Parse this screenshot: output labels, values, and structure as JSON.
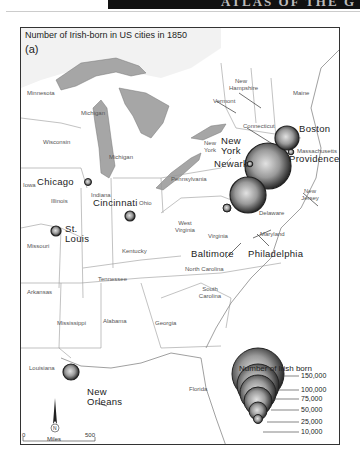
{
  "header": {
    "banner_text": "ATLAS OF THE G"
  },
  "map": {
    "title": "Number of Irish-born in US cities in 1850",
    "panel_label": "(a)",
    "states": [
      {
        "name": "Minnesota",
        "x": 6,
        "y": 62
      },
      {
        "name": "Michigan",
        "x": 60,
        "y": 82
      },
      {
        "name": "Wisconsin",
        "x": 22,
        "y": 111
      },
      {
        "name": "Michigan",
        "x": 88,
        "y": 126
      },
      {
        "name": "Iowa",
        "x": 2,
        "y": 154
      },
      {
        "name": "Illinois",
        "x": 30,
        "y": 170
      },
      {
        "name": "Indiana",
        "x": 70,
        "y": 164
      },
      {
        "name": "Ohio",
        "x": 118,
        "y": 172
      },
      {
        "name": "Pennsylvania",
        "x": 150,
        "y": 148
      },
      {
        "name": "New Hampshire",
        "x": 210,
        "y": 50
      },
      {
        "name": "Vermont",
        "x": 192,
        "y": 70
      },
      {
        "name": "Maine",
        "x": 272,
        "y": 62
      },
      {
        "name": "Connecticut",
        "x": 222,
        "y": 95
      },
      {
        "name": "New York",
        "x": 166,
        "y": 115
      },
      {
        "name": "Massachusetts",
        "x": 276,
        "y": 120
      },
      {
        "name": "New Jersey",
        "x": 282,
        "y": 160
      },
      {
        "name": "Delaware",
        "x": 238,
        "y": 182
      },
      {
        "name": "Maryland",
        "x": 239,
        "y": 203
      },
      {
        "name": "West Virginia",
        "x": 153,
        "y": 192
      },
      {
        "name": "Virginia",
        "x": 187,
        "y": 205
      },
      {
        "name": "Missouri",
        "x": 6,
        "y": 215
      },
      {
        "name": "Kentucky",
        "x": 101,
        "y": 220
      },
      {
        "name": "North Carolina",
        "x": 164,
        "y": 238
      },
      {
        "name": "Tennessee",
        "x": 77,
        "y": 248
      },
      {
        "name": "South Carolina",
        "x": 179,
        "y": 258
      },
      {
        "name": "Arkansas",
        "x": 6,
        "y": 261
      },
      {
        "name": "Mississippi",
        "x": 36,
        "y": 292
      },
      {
        "name": "Alabama",
        "x": 82,
        "y": 290
      },
      {
        "name": "Georgia",
        "x": 134,
        "y": 292
      },
      {
        "name": "Louisiana",
        "x": 8,
        "y": 337
      },
      {
        "name": "Florida",
        "x": 168,
        "y": 358
      }
    ],
    "cities": [
      {
        "name": "Boston",
        "x": 278,
        "y": 96
      },
      {
        "name": "New York",
        "x": 200,
        "y": 108,
        "multiline": "New\nYork"
      },
      {
        "name": "Newark",
        "x": 192,
        "y": 131
      },
      {
        "name": "Providence",
        "x": 268,
        "y": 126
      },
      {
        "name": "Chicago",
        "x": 18,
        "y": 154
      },
      {
        "name": "Cincinnati",
        "x": 72,
        "y": 176
      },
      {
        "name": "St. Louis",
        "x": 48,
        "y": 198
      },
      {
        "name": "Baltimore",
        "x": 170,
        "y": 221
      },
      {
        "name": "Philadelphia",
        "x": 227,
        "y": 221
      },
      {
        "name": "New Orleans",
        "x": 76,
        "y": 358
      }
    ],
    "symbols": [
      {
        "city": "New York",
        "cx": 247,
        "cy": 165,
        "r": 23
      },
      {
        "city": "Philadelphia",
        "cx": 230,
        "cy": 191,
        "r": 18
      },
      {
        "city": "Boston",
        "cx": 288,
        "cy": 139,
        "r": 12
      },
      {
        "city": "New Orleans",
        "cx": 70,
        "cy": 373,
        "r": 8
      },
      {
        "city": "St. Louis",
        "cx": 55,
        "cy": 231,
        "r": 5
      },
      {
        "city": "Cincinnati",
        "cx": 130,
        "cy": 218,
        "r": 5
      },
      {
        "city": "Chicago",
        "cx": 87,
        "cy": 182,
        "r": 3.5
      },
      {
        "city": "Baltimore",
        "cx": 228,
        "cy": 209,
        "r": 4
      },
      {
        "city": "Newark",
        "cx": 249,
        "cy": 163,
        "r": 2.5
      },
      {
        "city": "Providence",
        "cx": 290,
        "cy": 152,
        "r": 2.5
      }
    ]
  },
  "legend": {
    "title": "Number of Irish born",
    "values": [
      "150,000",
      "100,000",
      "75,000",
      "50,000",
      "25,000",
      "10,000"
    ]
  },
  "scale_bar": {
    "start": "0",
    "unit": "Miles",
    "end": "500"
  },
  "north_arrow": {
    "label": "N"
  }
}
